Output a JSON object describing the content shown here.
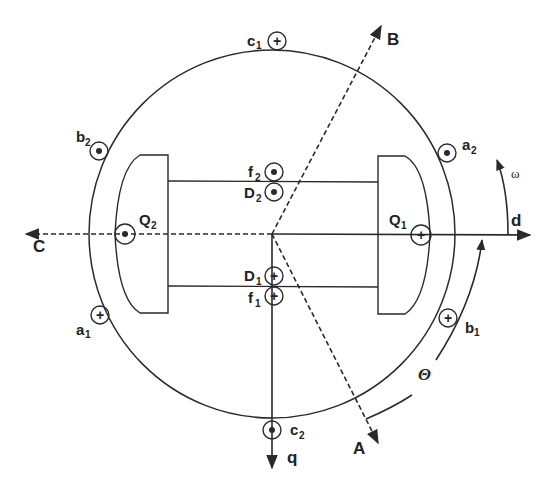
{
  "diagram": {
    "axes": {
      "d": "d",
      "q": "q",
      "A": "A",
      "B": "B",
      "C": "C"
    },
    "rotation": {
      "omega": "ω",
      "theta": "Θ"
    },
    "conductors": [
      {
        "id": "c1",
        "base": "c",
        "sub": "1",
        "symbol": "plus"
      },
      {
        "id": "c2",
        "base": "c",
        "sub": "2",
        "symbol": "dot"
      },
      {
        "id": "a1",
        "base": "a",
        "sub": "1",
        "symbol": "plus"
      },
      {
        "id": "a2",
        "base": "a",
        "sub": "2",
        "symbol": "dot"
      },
      {
        "id": "b1",
        "base": "b",
        "sub": "1",
        "symbol": "plus"
      },
      {
        "id": "b2",
        "base": "b",
        "sub": "2",
        "symbol": "dot"
      },
      {
        "id": "f1",
        "base": "f",
        "sub": "1",
        "symbol": "plus"
      },
      {
        "id": "f2",
        "base": "f",
        "sub": "2",
        "symbol": "dot"
      },
      {
        "id": "D1",
        "base": "D",
        "sub": "1",
        "symbol": "plus"
      },
      {
        "id": "D2",
        "base": "D",
        "sub": "2",
        "symbol": "dot"
      },
      {
        "id": "Q1",
        "base": "Q",
        "sub": "1",
        "symbol": "plus"
      },
      {
        "id": "Q2",
        "base": "Q",
        "sub": "2",
        "symbol": "dot"
      }
    ],
    "colors": {
      "line": "#2a2a2a",
      "background": "#ffffff"
    }
  }
}
